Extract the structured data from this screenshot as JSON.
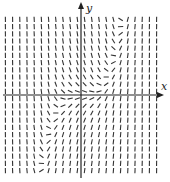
{
  "diagram": {
    "type": "slope-field",
    "axes": {
      "x_label": "x",
      "y_label": "y",
      "color": "#222222"
    },
    "field": {
      "description": "Direction field; slopes are near zero along a cubic-like curve through the origin, steep elsewhere",
      "segment_color": "#333333",
      "grid_spacing_px": 7.2,
      "columns": 22,
      "rows": 23
    }
  }
}
